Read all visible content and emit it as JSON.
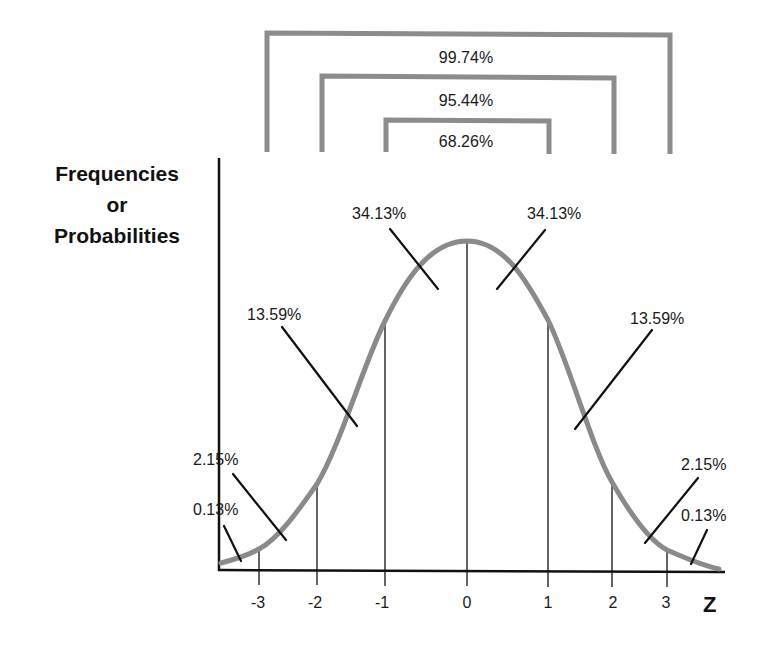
{
  "diagram": {
    "y_axis_label": [
      "Frequencies",
      "or",
      "Probabilities"
    ],
    "x_axis_label": "Z",
    "x_ticks": [
      "-3",
      "-2",
      "-1",
      "0",
      "1",
      "2",
      "3"
    ],
    "brackets": [
      {
        "label": "99.74%",
        "range": "-3 to 3"
      },
      {
        "label": "95.44%",
        "range": "-2 to 2"
      },
      {
        "label": "68.26%",
        "range": "-1 to 1"
      }
    ],
    "region_labels": {
      "left_0_13": "0.13%",
      "left_2_15": "2.15%",
      "left_13_59": "13.59%",
      "left_34_13": "34.13%",
      "right_34_13": "34.13%",
      "right_13_59": "13.59%",
      "right_2_15": "2.15%",
      "right_0_13": "0.13%"
    },
    "colors": {
      "curve": "#8a8a8a",
      "brackets": "#8c8c8c",
      "lines": "#111111",
      "background": "#ffffff"
    }
  }
}
